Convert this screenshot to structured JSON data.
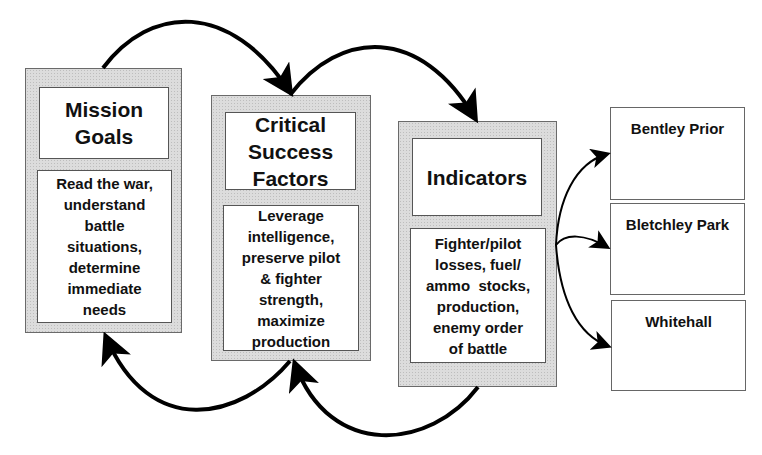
{
  "diagram": {
    "stages": [
      {
        "id": "mission-goals",
        "title": "Mission Goals",
        "title_lines": [
          "Mission",
          "Goals"
        ],
        "body_lines": [
          "Read the war,",
          "understand",
          "battle",
          "situations,",
          "determine",
          "immediate",
          "needs"
        ]
      },
      {
        "id": "critical-success-factors",
        "title": "Critical Success Factors",
        "title_lines": [
          "Critical",
          "Success",
          "Factors"
        ],
        "body_lines": [
          "Leverage",
          "intelligence,",
          "preserve pilot",
          "& fighter",
          "strength,",
          "maximize",
          "production"
        ]
      },
      {
        "id": "indicators",
        "title": "Indicators",
        "title_lines": [
          "Indicators"
        ],
        "body_lines": [
          "Fighter/pilot",
          "losses, fuel/",
          "ammo  stocks,",
          "production,",
          "enemy order",
          "of battle"
        ]
      }
    ],
    "destinations": [
      {
        "id": "bentley-prior",
        "label": "Bentley Prior"
      },
      {
        "id": "bletchley-park",
        "label": "Bletchley Park"
      },
      {
        "id": "whitehall",
        "label": "Whitehall"
      }
    ],
    "connections": [
      {
        "from": "mission-goals",
        "to": "critical-success-factors",
        "direction": "forward",
        "position": "top"
      },
      {
        "from": "critical-success-factors",
        "to": "indicators",
        "direction": "forward",
        "position": "top"
      },
      {
        "from": "critical-success-factors",
        "to": "mission-goals",
        "direction": "feedback",
        "position": "bottom"
      },
      {
        "from": "indicators",
        "to": "critical-success-factors",
        "direction": "feedback",
        "position": "bottom"
      },
      {
        "from": "indicators",
        "to": "bentley-prior",
        "direction": "forward",
        "position": "right"
      },
      {
        "from": "indicators",
        "to": "bletchley-park",
        "direction": "forward",
        "position": "right"
      },
      {
        "from": "indicators",
        "to": "whitehall",
        "direction": "forward",
        "position": "right"
      }
    ],
    "colors": {
      "stage_fill": "#dcdcdc",
      "stage_border": "#6a6a6a",
      "inner_fill": "#ffffff",
      "arrow": "#000000",
      "text": "#111111"
    }
  }
}
